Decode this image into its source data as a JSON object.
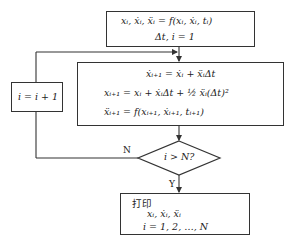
{
  "flowchart": {
    "init_box": {
      "line1": "xᵢ, ẋᵢ, ẍᵢ = f(xᵢ, ẋᵢ, tᵢ)",
      "line2": "Δt, i = 1"
    },
    "update_box": {
      "line1": "ẋᵢ₊₁ = ẋᵢ + ẍᵢΔt",
      "line2": "xᵢ₊₁ = xᵢ + ẋᵢΔt + ½ ẍᵢ(Δt)²",
      "line3": "ẍᵢ₊₁ = f(xᵢ₊₁, ẋᵢ₊₁, tᵢ₊₁)"
    },
    "increment_box": {
      "text": "i = i + 1"
    },
    "decision": {
      "text": "i > N?",
      "no_label": "N",
      "yes_label": "Y"
    },
    "output_box": {
      "title": "打印",
      "line1": "xᵢ, ẋᵢ, ẍᵢ",
      "line2": "i = 1, 2, …, N"
    }
  }
}
